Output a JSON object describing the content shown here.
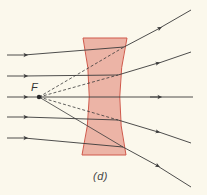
{
  "diagram": {
    "type": "diverging-lens-ray-diagram",
    "focal_point_label": "F",
    "caption": "(d)",
    "colors": {
      "background": "#fbf8ec",
      "lens_fill": "#e9a89a",
      "lens_stroke": "#d0584a",
      "ray": "#3a3a3a"
    },
    "lens": {
      "shape": "concave (diverging)",
      "top_y": 38,
      "bottom_y": 155,
      "top_left_x": 83,
      "top_right_x": 127,
      "waist_left_x": 92,
      "waist_right_x": 116
    },
    "focal_point": {
      "x": 39,
      "y": 97
    },
    "rays": [
      {
        "incoming_y": 55,
        "exit": [
          124,
          47
        ],
        "end": [
          191,
          10
        ]
      },
      {
        "incoming_y": 76,
        "exit": [
          118,
          75
        ],
        "end": [
          191,
          52
        ]
      },
      {
        "incoming_y": 97,
        "exit": [
          116,
          97
        ],
        "end": [
          193,
          97
        ]
      },
      {
        "incoming_y": 117,
        "exit": [
          118,
          120
        ],
        "end": [
          191,
          143
        ]
      },
      {
        "incoming_y": 138,
        "exit": [
          123,
          147
        ],
        "end": [
          191,
          187
        ]
      }
    ]
  }
}
